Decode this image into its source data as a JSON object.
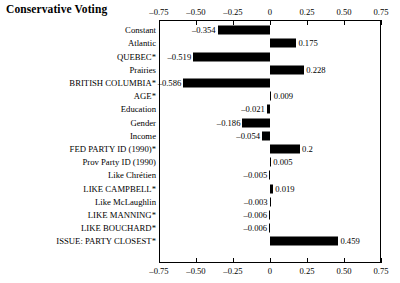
{
  "chart_data": {
    "type": "bar",
    "orientation": "horizontal",
    "title": "Conservative Voting",
    "xlabel": "",
    "ylabel": "",
    "xlim": [
      -0.75,
      0.75
    ],
    "xticks": [
      -0.75,
      -0.5,
      -0.25,
      0,
      0.25,
      0.5,
      0.75
    ],
    "xtick_labels": [
      "–0.75",
      "–0.50",
      "–0.25",
      "0",
      "0.25",
      "0.50",
      "0.75"
    ],
    "grid": false,
    "legend": null,
    "axis_duplicated_top_and_bottom": true,
    "bar_color": "#000000",
    "categories": [
      "Constant",
      "Atlantic",
      "QUEBEC*",
      "Prairies",
      "BRITISH COLUMBIA*",
      "AGE*",
      "Education",
      "Gender",
      "Income",
      "FED PARTY ID (1990)*",
      "Prov Party ID (1990)",
      "Like Chrétien",
      "LIKE CAMPBELL*",
      "Like McLaughlin",
      "LIKE MANNING*",
      "LIKE BOUCHARD*",
      "ISSUE: PARTY CLOSEST*"
    ],
    "values": [
      -0.354,
      0.175,
      -0.519,
      0.228,
      -0.586,
      0.009,
      -0.021,
      -0.186,
      -0.054,
      0.2,
      0.005,
      -0.005,
      0.019,
      -0.003,
      -0.006,
      -0.006,
      0.459
    ],
    "value_labels": [
      "–0.354",
      "0.175",
      "–0.519",
      "0.228",
      "–0.586",
      "0.009",
      "–0.021",
      "–0.186",
      "–0.054",
      "0.2",
      "0.005",
      "–0.005",
      "0.019",
      "–0.003",
      "–0.006",
      "–0.006",
      "0.459"
    ]
  }
}
